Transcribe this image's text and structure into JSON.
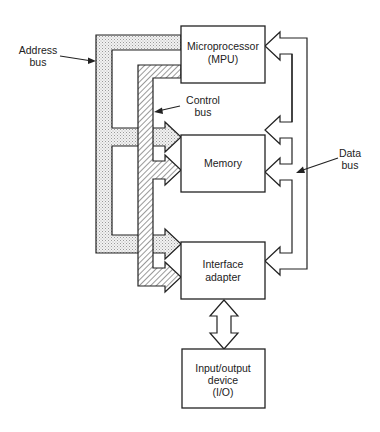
{
  "diagram": {
    "blocks": {
      "mpu": [
        "Microprocessor",
        "(MPU)"
      ],
      "memory": [
        "Memory"
      ],
      "interface": [
        "Interface",
        "adapter"
      ],
      "io": [
        "Input/output",
        "device",
        "(I/O)"
      ]
    },
    "labels": {
      "address_bus": [
        "Address",
        "bus"
      ],
      "control_bus": [
        "Control",
        "bus"
      ],
      "data_bus": [
        "Data",
        "bus"
      ]
    },
    "colors": {
      "line": "#222222",
      "background": "#ffffff",
      "address_fill": "dotted-gray",
      "control_fill": "hatched"
    }
  }
}
